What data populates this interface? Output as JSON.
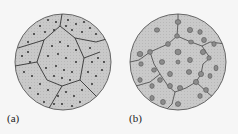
{
  "panels": [
    {
      "id": "a",
      "label": "(a)",
      "description": "Polycrystalline grains with finely dispersed precipitates (small dots) uniformly distributed within grains"
    },
    {
      "id": "b",
      "label": "(b)",
      "description": "Coarsened precipitates (larger ovals) with grain boundaries decorated by particles"
    }
  ],
  "colors": {
    "fill": "#c8c8c8",
    "edge": "#555555",
    "boundary": "#333333",
    "dot": "#222222",
    "particle": "#8a8a8a"
  }
}
